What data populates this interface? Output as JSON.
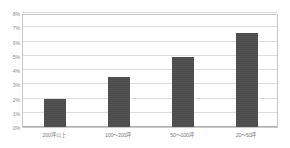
{
  "chart_data": {
    "type": "bar",
    "title": "",
    "subtitle": "",
    "xlabel": "",
    "ylabel": "",
    "categories": [
      "200坪以上",
      "100〜200坪",
      "50〜100坪",
      "20〜50坪"
    ],
    "values": [
      2.0,
      3.5,
      4.9,
      6.6
    ],
    "series": [
      {
        "name": "",
        "values": [
          2.0,
          3.5,
          4.9,
          6.6
        ]
      }
    ],
    "ylim": [
      0,
      8
    ],
    "ytick_labels": [
      "8%",
      "7%",
      "6%",
      "5%",
      "4%",
      "3%",
      "2%",
      "1%",
      "0%"
    ],
    "ytick_values": [
      8,
      7,
      6,
      5,
      4,
      3,
      2,
      1,
      0
    ],
    "grid": true,
    "legend": false,
    "legend_position": "none",
    "annotations": [],
    "colors": {
      "bar": "#4a4a4a",
      "gridline": "#dcdcdc",
      "axis": "#b0b0b0",
      "frame": "#c8c8c8",
      "tick_label": "#8a8a8a",
      "category_label": "#7d7d7d",
      "background": "#ffffff"
    }
  }
}
